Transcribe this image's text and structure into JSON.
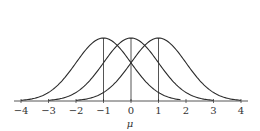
{
  "chart_data": {
    "type": "line",
    "title": "",
    "xlabel": "μ",
    "ylabel": "",
    "xlim": [
      -4,
      4
    ],
    "ylim": [
      0,
      0.4
    ],
    "grid": false,
    "legend": null,
    "x_ticks": [
      -4,
      -3,
      -2,
      -1,
      0,
      1,
      2,
      3,
      4
    ],
    "x_tick_labels": [
      "−4",
      "−3",
      "−2",
      "−1",
      "0",
      "1",
      "2",
      "3",
      "4"
    ],
    "series": [
      {
        "name": "N(-1,1)",
        "mean": -1,
        "sd": 1,
        "clip": [
          -4,
          1.8
        ]
      },
      {
        "name": "N(0,1)",
        "mean": 0,
        "sd": 1,
        "clip": [
          -3,
          3
        ]
      },
      {
        "name": "N(1,1)",
        "mean": 1,
        "sd": 1,
        "clip": [
          -2,
          4
        ]
      }
    ],
    "annotations": [
      "vertical lines at each mean: -1, 0, 1"
    ],
    "colors": {
      "curve": "#2a2a2a",
      "axis": "#444444"
    }
  }
}
